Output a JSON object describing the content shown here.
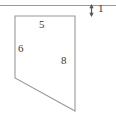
{
  "figure": {
    "kind": "geometry-diagram",
    "background_color": "#ffffff",
    "stroke_color": "#9a9a9a",
    "text_color": "#3a3a3a",
    "reference_line": {
      "name": "top-horizontal-reference-line",
      "x1": 0,
      "y1": 5,
      "x2": 116,
      "y2": 5
    },
    "polygon": {
      "name": "quadrilateral",
      "points": "15,16 75,16 75,111 15,78",
      "fill": "none"
    },
    "dimension": {
      "tick": {
        "x": 91,
        "y1": 5,
        "y2": 16
      },
      "arrow_up_y": 5,
      "arrow_down_y": 16
    },
    "labels": {
      "top_side": "5",
      "left_side": "6",
      "right_side": "8",
      "gap": "1"
    }
  }
}
